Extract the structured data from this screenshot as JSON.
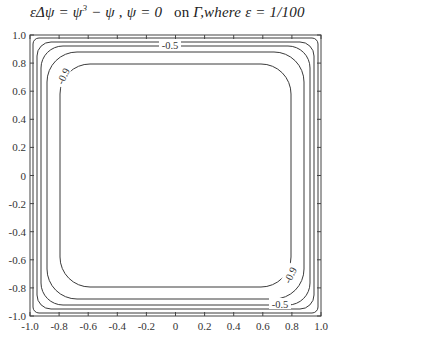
{
  "chart_data": {
    "type": "contour",
    "title_parts": {
      "equation": "εΔψ = ψ",
      "power": "3",
      "rest_eq": " − ψ , ψ = 0",
      "on": "on",
      "gamma": "Γ",
      "where": ",where ε = 1/100"
    },
    "xlabel": "",
    "ylabel": "",
    "xlim": [
      -1.0,
      1.0
    ],
    "ylim": [
      -1.0,
      1.0
    ],
    "x_ticks": [
      "-1.0",
      "-0.8",
      "-0.6",
      "-0.4",
      "-0.2",
      "0",
      "0.2",
      "0.4",
      "0.6",
      "0.8",
      "1.0"
    ],
    "y_ticks": [
      "1.0",
      "0.8",
      "0.6",
      "0.4",
      "0.2",
      "0",
      "-0.2",
      "-0.4",
      "-0.6",
      "-0.8",
      "-1.0"
    ],
    "grid": false,
    "legend": null,
    "contour_levels": [
      -0.1,
      -0.3,
      -0.5,
      -0.7,
      -0.9
    ],
    "labeled_levels": [
      {
        "text": "-0.5",
        "position": "top-center"
      },
      {
        "text": "-0.9",
        "position": "upper-left"
      },
      {
        "text": "-0.9",
        "position": "lower-right"
      },
      {
        "text": "-0.5",
        "position": "bottom-right"
      }
    ],
    "contour_inset_fraction_of_half_width": [
      0.02,
      0.045,
      0.075,
      0.115,
      0.2
    ]
  }
}
